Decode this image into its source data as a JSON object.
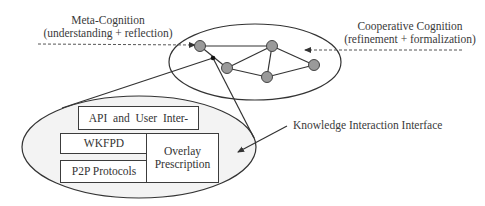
{
  "diagram": {
    "labels": {
      "meta_cognition": {
        "title": "Meta-Cognition",
        "subtitle": "(understanding + reflection)"
      },
      "cooperative_cognition": {
        "title": "Cooperative Cognition",
        "subtitle": "(refinement + formalization)"
      },
      "knowledge_interface": "Knowledge Interaction Interface"
    },
    "stack": {
      "api": "API  and  User  Inter-",
      "wkfpd": "WKFPD",
      "p2p": "P2P Protocols",
      "overlay_line1": "Overlay",
      "overlay_line2": "Prescription"
    },
    "network": {
      "nodes": [
        {
          "id": "A",
          "x": 200,
          "y": 46
        },
        {
          "id": "B",
          "x": 227,
          "y": 68
        },
        {
          "id": "C",
          "x": 272,
          "y": 46
        },
        {
          "id": "D",
          "x": 267,
          "y": 77
        },
        {
          "id": "E",
          "x": 314,
          "y": 65
        }
      ],
      "edges": [
        [
          "A",
          "C"
        ],
        [
          "A",
          "B"
        ],
        [
          "B",
          "C"
        ],
        [
          "B",
          "D"
        ],
        [
          "C",
          "D"
        ],
        [
          "C",
          "E"
        ],
        [
          "D",
          "E"
        ]
      ]
    },
    "colors": {
      "node_fill": "#9a9a9a",
      "line": "#333333",
      "ellipse_fill": "#f3f3f3"
    }
  }
}
